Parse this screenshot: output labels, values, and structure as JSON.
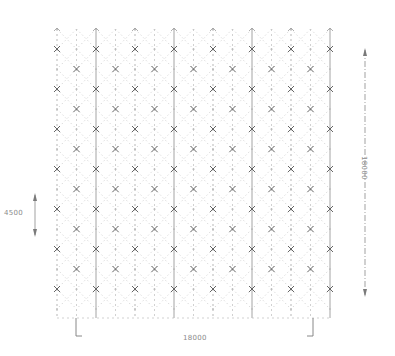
{
  "diagram": {
    "type": "space-frame-grid-plan",
    "colors": {
      "background": "#ffffff",
      "grid_dots": "#bdbdbd",
      "major_lines": "#9a9a9a",
      "x_markers": "#555555",
      "dimension_lines": "#7a7a7a",
      "labels": "#8a8a8a"
    },
    "grid": {
      "x_start": 57,
      "x_end": 330,
      "y_start": 29,
      "y_end": 318,
      "column_pitch": 39,
      "row_pitch": 20,
      "major_columns": 8,
      "rows": 15
    },
    "dimensions": {
      "bottom": {
        "label": "18000",
        "orientation": "horizontal"
      },
      "right": {
        "label": "18000",
        "orientation": "vertical"
      },
      "left": {
        "label": "4500",
        "orientation": "vertical"
      }
    }
  }
}
